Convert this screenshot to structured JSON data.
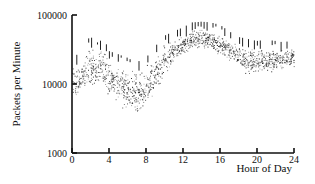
{
  "chart_data": {
    "type": "scatter",
    "title": "",
    "xlabel": "Hour of Day",
    "ylabel": "Packets per Minute",
    "xlim": [
      0,
      24
    ],
    "ylim": [
      1000,
      100000
    ],
    "yscale": "log",
    "grid": false,
    "legend": null,
    "x_ticks": [
      0,
      4,
      8,
      12,
      16,
      20,
      24
    ],
    "y_ticks": [
      1000,
      10000,
      100000
    ],
    "y_tick_labels": [
      "1000",
      "10000",
      "100000"
    ],
    "x_tick_labels": [
      "0",
      "4",
      "8",
      "12",
      "16",
      "20",
      "24"
    ],
    "series": [
      {
        "name": "upper envelope (peak bars)",
        "x": [
          0,
          1,
          1.5,
          2,
          2.5,
          3,
          3.5,
          4,
          5,
          6,
          6.5,
          7,
          7.5,
          8,
          9,
          10,
          11,
          12,
          13,
          14,
          15,
          16,
          17,
          18,
          19,
          20,
          21,
          22,
          23,
          24
        ],
        "values": [
          25000,
          28000,
          40000,
          50000,
          38000,
          42000,
          45000,
          30000,
          27000,
          24000,
          22000,
          21000,
          22000,
          24000,
          35000,
          50000,
          58000,
          66000,
          78000,
          80000,
          78000,
          72000,
          58000,
          48000,
          45000,
          42000,
          44000,
          42000,
          40000,
          45000
        ]
      },
      {
        "name": "typical traffic (scatter center)",
        "x": [
          0,
          1,
          2,
          3,
          4,
          5,
          6,
          7,
          8,
          9,
          10,
          11,
          12,
          13,
          14,
          15,
          16,
          17,
          18,
          19,
          20,
          21,
          22,
          23,
          24
        ],
        "values": [
          20000,
          18000,
          22000,
          20000,
          14000,
          10000,
          7000,
          6000,
          8000,
          14000,
          25000,
          35000,
          45000,
          55000,
          60000,
          58000,
          50000,
          38000,
          32000,
          30000,
          28000,
          28000,
          27000,
          26000,
          27000
        ]
      },
      {
        "name": "lower envelope (scatter minimum)",
        "x": [
          0,
          0.5,
          1,
          2,
          3,
          4,
          5,
          6,
          7,
          8,
          9,
          10,
          11,
          12,
          13,
          14,
          15,
          16,
          17,
          18,
          19,
          20,
          21,
          22,
          23,
          24
        ],
        "values": [
          6000,
          5500,
          6500,
          8000,
          9000,
          6000,
          4500,
          3500,
          3200,
          4000,
          7000,
          13000,
          20000,
          25000,
          30000,
          32000,
          30000,
          25000,
          20000,
          15000,
          12000,
          14000,
          13000,
          14000,
          15000,
          17000
        ]
      }
    ]
  }
}
